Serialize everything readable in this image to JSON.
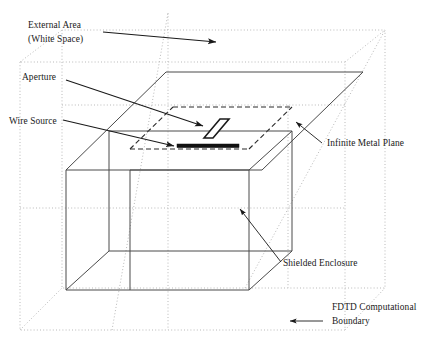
{
  "figure": {
    "labels": {
      "external_area_line1": "External Area",
      "external_area_line2": "(White Space)",
      "aperture": "Aperture",
      "wire_source": "Wire Source",
      "infinite_metal_plane": "Infinite Metal Plane",
      "shielded_enclosure": "Shielded Enclosure",
      "fdtd_boundary_line1": "FDTD Computational",
      "fdtd_boundary_line2": "Boundary"
    },
    "colors": {
      "background": "#ffffff",
      "solid_stroke": "#4a4a4a",
      "dark_stroke": "#2b2b2b",
      "dotted_boundary": "#b9b9b9",
      "leader": "#1a1a1a",
      "wire_fill": "#111111",
      "text": "#1a1a1a"
    },
    "elements": {
      "metal_plane": "large parallelogram representing infinite metal plane",
      "enclosure": "rectangular box below plane representing shielded enclosure",
      "aperture": "narrow tilted slot in metal plane",
      "wire_source": "thick horizontal bar beneath aperture",
      "boundary": "dotted outer cube representing FDTD computational boundary"
    }
  }
}
